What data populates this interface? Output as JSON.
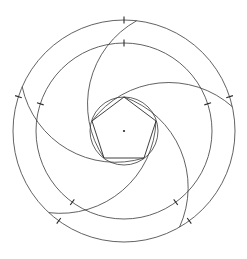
{
  "figure": {
    "background_color": "#ffffff",
    "stroke_color": "#3a3a3a",
    "accent_color": "#2a2a2a",
    "width": 247,
    "height": 259
  },
  "chart_data": {
    "type": "diagram",
    "center": {
      "x": 124,
      "y": 131
    },
    "symmetry_order": 5,
    "circles": [
      {
        "name": "outer-circle",
        "radius": 111,
        "ticks": 5
      },
      {
        "name": "middle-circle",
        "radius": 88,
        "ticks": 5
      },
      {
        "name": "inner-circle",
        "radius": 34,
        "ticks": 0
      }
    ],
    "pentagon": {
      "name": "inscribed-pentagon",
      "circumradius": 34,
      "rotation_deg": -90,
      "vertices": [
        {
          "x": 124,
          "y": 97
        },
        {
          "x": 156,
          "y": 121
        },
        {
          "x": 144,
          "y": 158
        },
        {
          "x": 104,
          "y": 158
        },
        {
          "x": 92,
          "y": 121
        }
      ]
    },
    "spiral_arcs": {
      "count": 5,
      "description": "Five congruent arcs, each running from a pentagon vertex outward to the outer circle, rotated 72 degrees apart",
      "start_radius": 34,
      "end_radius": 111,
      "sweep_deg": 150
    },
    "tick_marks": {
      "style": "short radial dash",
      "length": 7,
      "outer_circle_angles_deg": [
        -90,
        -18,
        54,
        126,
        198
      ],
      "middle_circle_angles_deg": [
        -90,
        -18,
        54,
        126,
        198
      ]
    },
    "center_marker": {
      "name": "center-dot",
      "radius": 1.1
    },
    "grid": false,
    "legend": null,
    "xlabel": "",
    "ylabel": ""
  }
}
